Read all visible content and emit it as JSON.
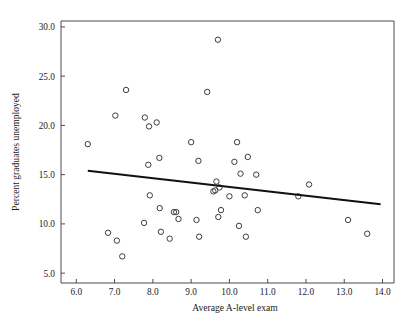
{
  "chart_data": {
    "type": "scatter",
    "title": "",
    "xlabel": "Average A-level exam",
    "ylabel": "Percent graduates unemployed",
    "xlim": [
      5.6,
      14.3
    ],
    "ylim": [
      4.0,
      30.6
    ],
    "xticks": [
      "6.0",
      "7.0",
      "8.0",
      "9.0",
      "10.0",
      "11.0",
      "12.0",
      "13.0",
      "14.0"
    ],
    "xtick_values": [
      6.0,
      7.0,
      8.0,
      9.0,
      10.0,
      11.0,
      12.0,
      13.0,
      14.0
    ],
    "yticks": [
      "5.0",
      "10.0",
      "15.0",
      "20.0",
      "25.0",
      "30.0"
    ],
    "ytick_values": [
      5.0,
      10.0,
      15.0,
      20.0,
      25.0,
      30.0
    ],
    "grid": false,
    "legend": null,
    "marker": "open-circle",
    "points": [
      [
        6.3,
        18.1
      ],
      [
        6.83,
        9.1
      ],
      [
        7.02,
        21.0
      ],
      [
        7.06,
        8.3
      ],
      [
        7.2,
        6.7
      ],
      [
        7.3,
        23.6
      ],
      [
        7.77,
        10.1
      ],
      [
        7.79,
        20.8
      ],
      [
        7.88,
        16.0
      ],
      [
        7.9,
        19.9
      ],
      [
        7.92,
        12.9
      ],
      [
        8.1,
        20.3
      ],
      [
        8.17,
        16.7
      ],
      [
        8.18,
        11.6
      ],
      [
        8.21,
        9.2
      ],
      [
        8.44,
        8.5
      ],
      [
        8.55,
        11.2
      ],
      [
        8.61,
        11.2
      ],
      [
        8.67,
        10.5
      ],
      [
        9.0,
        18.3
      ],
      [
        9.14,
        10.4
      ],
      [
        9.19,
        16.4
      ],
      [
        9.21,
        8.7
      ],
      [
        9.42,
        23.4
      ],
      [
        9.58,
        13.3
      ],
      [
        9.63,
        13.4
      ],
      [
        9.66,
        14.3
      ],
      [
        9.7,
        28.7
      ],
      [
        9.71,
        10.7
      ],
      [
        9.74,
        13.7
      ],
      [
        9.78,
        11.4
      ],
      [
        10.0,
        12.8
      ],
      [
        10.13,
        16.3
      ],
      [
        10.2,
        18.3
      ],
      [
        10.25,
        9.8
      ],
      [
        10.29,
        15.1
      ],
      [
        10.4,
        12.9
      ],
      [
        10.43,
        8.7
      ],
      [
        10.48,
        16.8
      ],
      [
        10.7,
        15.0
      ],
      [
        10.74,
        11.4
      ],
      [
        11.8,
        12.8
      ],
      [
        12.08,
        14.0
      ],
      [
        13.1,
        10.4
      ],
      [
        13.6,
        9.0
      ]
    ],
    "trend_line": {
      "style": "solid",
      "color": "#111111",
      "x_start": 6.3,
      "y_start": 15.4,
      "x_end": 13.95,
      "y_end": 12.0
    }
  }
}
